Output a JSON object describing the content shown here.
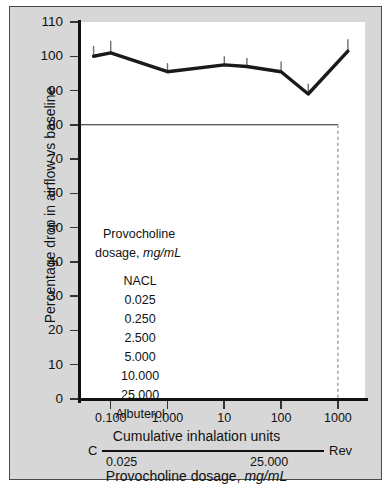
{
  "chart_data": {
    "type": "line",
    "title": "",
    "xlabel": "Cumulative inhalation units",
    "ylabel": "Percentage drop in airflow vs baseline",
    "xscale": "log",
    "xlim": [
      0.03,
      3000
    ],
    "ylim": [
      0,
      110
    ],
    "yticks": [
      0,
      10,
      20,
      30,
      40,
      50,
      60,
      70,
      80,
      90,
      100,
      110
    ],
    "xticks": [
      0.1,
      1.0,
      10,
      100,
      1000
    ],
    "xtick_labels": [
      "0.100",
      "1.000",
      "10",
      "100",
      "1000"
    ],
    "grid": false,
    "legend_position": "inside-lower-left",
    "series": [
      {
        "name": "Provocholine challenge",
        "x": [
          0.05,
          0.1,
          1.0,
          10,
          25,
          100,
          300,
          1500
        ],
        "y": [
          100.0,
          101.0,
          95.5,
          97.5,
          97.0,
          95.5,
          89.0,
          101.5
        ],
        "errors_upper": [
          3.0,
          3.5,
          2.5,
          2.5,
          2.5,
          3.0,
          3.0,
          3.5
        ],
        "color": "#1a1a1a"
      }
    ],
    "reference_lines": [
      {
        "type": "horizontal",
        "value": 80,
        "style": "solid",
        "color": "#222222"
      },
      {
        "type": "vertical",
        "value": 1000,
        "style": "dashed",
        "color": "#888888"
      }
    ],
    "annotations": []
  },
  "axes": {
    "y_title": "Percentage drop in airflow vs baseline",
    "x_title": "Cumulative inhalation units",
    "y_tick_labels": [
      "110",
      "100",
      "90",
      "80",
      "70",
      "60",
      "50",
      "40",
      "30",
      "20",
      "10",
      "0"
    ],
    "x_tick_labels": [
      "0.100",
      "1.000",
      "10",
      "100",
      "1000"
    ]
  },
  "secondary_axis": {
    "left_cap": "C",
    "right_cap": "Rev",
    "left_value": "0.025",
    "right_value": "25.000",
    "title_plain": "Provocholine dosage, ",
    "title_italic": "mg/mL"
  },
  "legend": {
    "header_line1": "Provocholine",
    "header_line2_plain": "dosage, ",
    "header_line2_italic": "mg/mL",
    "items": [
      "NACL",
      "0.025",
      "0.250",
      "2.500",
      "5.000",
      "10.000",
      "25.000",
      "Albuterol"
    ]
  },
  "colors": {
    "panel_background": "#d7d7d7",
    "plot_background": "#ffffff",
    "line": "#1a1a1a",
    "axis": "#111111",
    "dashed_reference": "#888888",
    "border": "#4a4a4a"
  }
}
